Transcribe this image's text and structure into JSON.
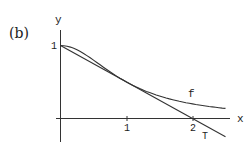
{
  "panel_label": "(b)",
  "chart_data": {
    "type": "line",
    "title": "",
    "xlabel": "x",
    "ylabel": "y",
    "xlim": [
      -0.06,
      2.6
    ],
    "ylim": [
      -0.32,
      1.2
    ],
    "xticks": [
      1,
      2
    ],
    "xtick_labels": [
      "1",
      "2"
    ],
    "yticks": [
      1
    ],
    "ytick_labels": [
      "1"
    ],
    "grid": false,
    "series": [
      {
        "name": "f",
        "label": "f",
        "expression": "1/(1+x^2)",
        "x": [
          0,
          0.25,
          0.5,
          0.75,
          1.0,
          1.25,
          1.5,
          1.75,
          2.0,
          2.25,
          2.5
        ],
        "y": [
          1.0,
          0.941,
          0.8,
          0.64,
          0.5,
          0.39,
          0.308,
          0.246,
          0.2,
          0.165,
          0.138
        ]
      },
      {
        "name": "T",
        "label": "T",
        "expression": "1 - x/2",
        "x": [
          0,
          2.5
        ],
        "y": [
          1.0,
          -0.25
        ]
      }
    ],
    "annotations": [
      {
        "text": "f",
        "x": 2.0,
        "y": 0.33
      },
      {
        "text": "T",
        "x": 2.2,
        "y": -0.23
      }
    ]
  }
}
